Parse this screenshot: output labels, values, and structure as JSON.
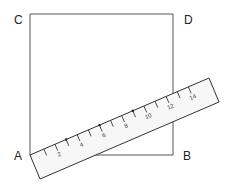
{
  "figure": {
    "type": "geometry-diagram"
  },
  "square": {
    "vertices": {
      "top_left": "C",
      "top_right": "D",
      "bottom_right": "B",
      "bottom_left": "A"
    }
  },
  "ruler": {
    "origin_vertex": "A",
    "min_value": 0,
    "max_value": 14,
    "tick_values": [
      0,
      1,
      2,
      3,
      4,
      5,
      6,
      7,
      8,
      9,
      10,
      11,
      12,
      13,
      14
    ],
    "labels": [
      "2",
      "4",
      "6",
      "8",
      "10",
      "12",
      "14"
    ],
    "label_values": [
      2,
      4,
      6,
      8,
      10,
      12,
      14
    ],
    "dot_marks": [
      3,
      6,
      9
    ],
    "crosses_square_side_at": 12
  },
  "colors": {
    "square_edge": "#555555",
    "ruler_edge": "#333333",
    "ruler_fill": "#f7f7f7",
    "text": "#222222"
  }
}
